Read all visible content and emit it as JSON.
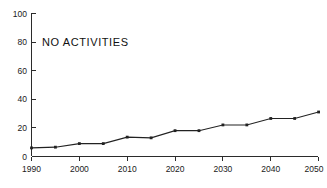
{
  "chart_data": {
    "type": "line",
    "title": "NO ACTIVITIES",
    "xlabel": "",
    "ylabel": "",
    "x": [
      1990,
      1995,
      2000,
      2005,
      2010,
      2015,
      2020,
      2025,
      2030,
      2035,
      2040,
      2045,
      2050
    ],
    "values": [
      6,
      6.5,
      9,
      9,
      13.5,
      13,
      18,
      18,
      22,
      22,
      26.5,
      26.5,
      31
    ],
    "series": [
      {
        "name": "NO ACTIVITIES",
        "values": [
          6,
          6.5,
          9,
          9,
          13.5,
          13,
          18,
          18,
          22,
          22,
          26.5,
          26.5,
          31
        ]
      }
    ],
    "xlim": [
      1990,
      2050
    ],
    "ylim": [
      0,
      100
    ],
    "y_ticks": [
      0,
      20,
      40,
      60,
      80,
      100
    ],
    "y_tick_labels": [
      "0",
      "20",
      "40",
      "60",
      "80",
      "100"
    ],
    "x_ticks": [
      1990,
      2000,
      2010,
      2020,
      2030,
      2040,
      2050
    ],
    "x_tick_labels": [
      "1990",
      "2000",
      "2010",
      "2020",
      "2030",
      "2040",
      "2050"
    ],
    "x_minor_ticks": [
      1995,
      2005,
      2015,
      2025,
      2035,
      2045
    ],
    "grid": false,
    "legend": false,
    "marker": "square",
    "line_color": "#222222",
    "axis_color": "#2b2b2b",
    "background_color": "#ffffff"
  },
  "chart": {
    "title": "NO ACTIVITIES",
    "y_labels": {
      "t0": "0",
      "t1": "20",
      "t2": "40",
      "t3": "60",
      "t4": "80",
      "t5": "100"
    },
    "x_labels": {
      "t0": "1990",
      "t1": "2000",
      "t2": "2010",
      "t3": "2020",
      "t4": "2030",
      "t5": "2040",
      "t6": "2050"
    }
  }
}
